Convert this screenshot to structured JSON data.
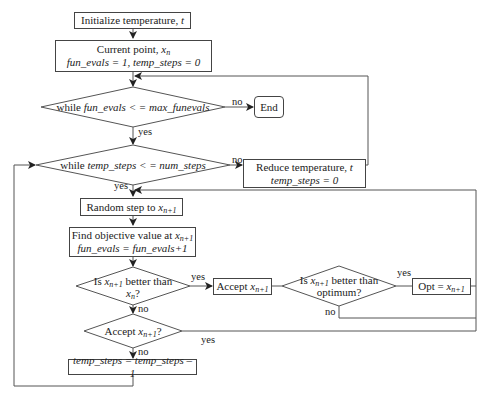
{
  "nodes": {
    "init": {
      "text": "Initialize temperature,",
      "var": "t"
    },
    "current": {
      "line1": "Current point,",
      "var": "x",
      "sub": "n",
      "line2": "fun_evals = 1, temp_steps = 0"
    },
    "while_funevals": {
      "pre": "while",
      "cond": "fun_evals < = max_funevals"
    },
    "end": {
      "text": "End"
    },
    "while_tempsteps": {
      "pre": "while",
      "cond": "temp_steps < = num_steps"
    },
    "reduce_temp": {
      "line1": "Reduce temperature,",
      "var": "t",
      "line2": "temp_steps = 0"
    },
    "random_step": {
      "text": "Random step to",
      "var": "x",
      "sub": "n+1"
    },
    "find_objective": {
      "line1": "Find objective value at",
      "var": "x",
      "sub": "n+1",
      "line2": "fun_evals = fun_evals+1"
    },
    "is_better": {
      "line1a": "Is",
      "var": "x",
      "sub": "n+1",
      "line1b": "better than",
      "var2": "x",
      "sub2": "n",
      "q": "?"
    },
    "accept": {
      "text": "Accept",
      "var": "x",
      "sub": "n+1"
    },
    "is_better_opt": {
      "line1a": "Is",
      "var": "x",
      "sub": "n+1",
      "line1b": "better than",
      "line2": "optimum?"
    },
    "opt": {
      "text": "Opt =",
      "var": "x",
      "sub": "n+1"
    },
    "accept_q": {
      "text": "Accept",
      "var": "x",
      "sub": "n+1",
      "q": "?"
    },
    "decrement": {
      "text": "temp_steps = temp_steps – 1"
    }
  },
  "edge_labels": {
    "yes": "yes",
    "no": "no"
  }
}
